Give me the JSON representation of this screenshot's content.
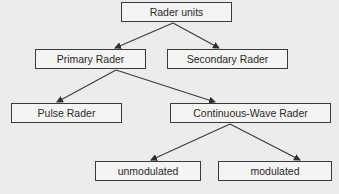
{
  "diagram": {
    "type": "tree",
    "nodes": [
      {
        "id": "root",
        "label": "Rader units",
        "x": 121,
        "y": 2,
        "w": 111,
        "h": 20
      },
      {
        "id": "primary",
        "label": "Primary Rader",
        "x": 35,
        "y": 49,
        "w": 111,
        "h": 20
      },
      {
        "id": "secondary",
        "label": "Secondary Rader",
        "x": 167,
        "y": 49,
        "w": 121,
        "h": 20
      },
      {
        "id": "pulse",
        "label": "Pulse Rader",
        "x": 11,
        "y": 103,
        "w": 111,
        "h": 20
      },
      {
        "id": "cw",
        "label": "Continuous-Wave Rader",
        "x": 170,
        "y": 103,
        "w": 161,
        "h": 20
      },
      {
        "id": "unmod",
        "label": "unmodulated",
        "x": 95,
        "y": 161,
        "w": 106,
        "h": 20
      },
      {
        "id": "mod",
        "label": "modulated",
        "x": 218,
        "y": 161,
        "w": 114,
        "h": 20
      }
    ],
    "edges": [
      {
        "from": "root",
        "to": "primary",
        "x1": 173,
        "y1": 23,
        "x2": 115,
        "y2": 48
      },
      {
        "from": "root",
        "to": "secondary",
        "x1": 173,
        "y1": 23,
        "x2": 219,
        "y2": 48
      },
      {
        "from": "primary",
        "to": "pulse",
        "x1": 116,
        "y1": 70,
        "x2": 57,
        "y2": 102
      },
      {
        "from": "primary",
        "to": "cw",
        "x1": 116,
        "y1": 70,
        "x2": 215,
        "y2": 102
      },
      {
        "from": "cw",
        "to": "unmod",
        "x1": 230,
        "y1": 124,
        "x2": 151,
        "y2": 160
      },
      {
        "from": "cw",
        "to": "mod",
        "x1": 230,
        "y1": 124,
        "x2": 300,
        "y2": 160
      }
    ],
    "colors": {
      "line": "#3a3a3a",
      "box_border": "#3a3a3a",
      "background": "#ececea",
      "box_fill": "#f4f4f2",
      "text": "#2a2a2a"
    }
  },
  "labels": {
    "root": "Rader units",
    "primary": "Primary Rader",
    "secondary": "Secondary Rader",
    "pulse": "Pulse Rader",
    "cw": "Continuous-Wave Rader",
    "unmod": "unmodulated",
    "mod": "modulated"
  }
}
